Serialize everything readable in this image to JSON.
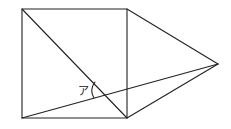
{
  "diagram": {
    "stroke_color": "#222222",
    "background": "#ffffff",
    "points": {
      "square_top_left": [
        22,
        9
      ],
      "square_top_right": [
        127,
        9
      ],
      "square_bottom_right": [
        127,
        118
      ],
      "square_bottom_left": [
        22,
        118
      ],
      "triangle_apex": [
        218,
        64
      ]
    },
    "angle_label": {
      "text": "ア",
      "position": [
        79,
        93
      ]
    }
  }
}
